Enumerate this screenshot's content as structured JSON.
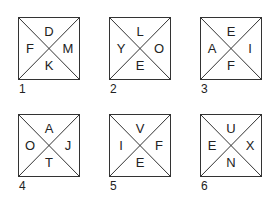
{
  "boxes": [
    {
      "number": "1",
      "top": "D",
      "left": "F",
      "right": "M",
      "bottom": "K"
    },
    {
      "number": "2",
      "top": "L",
      "left": "Y",
      "right": "O",
      "bottom": "E"
    },
    {
      "number": "3",
      "top": "E",
      "left": "A",
      "right": "I",
      "bottom": "F"
    },
    {
      "number": "4",
      "top": "A",
      "left": "O",
      "right": "J",
      "bottom": "T"
    },
    {
      "number": "5",
      "top": "V",
      "left": "I",
      "right": "F",
      "bottom": "E"
    },
    {
      "number": "6",
      "top": "U",
      "left": "E",
      "right": "X",
      "bottom": "N"
    }
  ]
}
